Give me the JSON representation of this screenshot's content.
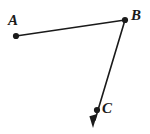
{
  "figure": {
    "background_color": "#ffffff",
    "stroke_color": "#1a1a1a",
    "label_color": "#1a1a1a",
    "width": 150,
    "height": 134,
    "points": [
      {
        "id": "A",
        "label": "A",
        "x": 16,
        "y": 36,
        "label_x": 8,
        "label_y": 14,
        "dot_radius": 3.1
      },
      {
        "id": "B",
        "label": "B",
        "x": 125,
        "y": 20,
        "label_x": 131,
        "label_y": 9,
        "dot_radius": 3.1
      },
      {
        "id": "C",
        "label": "C",
        "x": 97,
        "y": 110,
        "label_x": 102,
        "label_y": 102,
        "dot_radius": 3.1
      }
    ],
    "segments": [
      {
        "id": "AB",
        "from": "A",
        "to": "B",
        "x1": 16,
        "y1": 36,
        "x2": 125,
        "y2": 20,
        "stroke_width": 1.6,
        "arrow": "none"
      },
      {
        "id": "BC-ray",
        "from": "B",
        "through": "C",
        "x1": 125,
        "y1": 20,
        "x2": 94,
        "y2": 124,
        "stroke_width": 1.6,
        "arrow": "end"
      }
    ],
    "arrowhead": {
      "id": "ray-arrowhead",
      "tip_x": 93,
      "tip_y": 128,
      "length": 11,
      "half_width": 3.6
    }
  }
}
